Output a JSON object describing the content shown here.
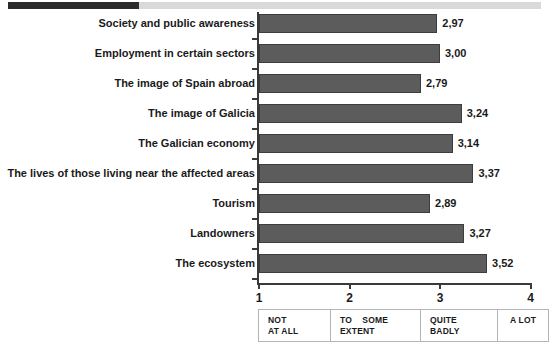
{
  "header_strip": {
    "name": "progress-strip",
    "fill_color": "#2b2b2b",
    "track_color": "#d9d9d9"
  },
  "chart_data": {
    "type": "bar",
    "orientation": "horizontal",
    "title": "",
    "xlabel": "",
    "ylabel": "",
    "xlim": [
      1,
      4
    ],
    "grid": false,
    "legend_position": "below-axis",
    "bar_color": "#5c5c5c",
    "categories": [
      "Society and public awareness",
      "Employment in certain sectors",
      "The image of Spain abroad",
      "The image of Galicia",
      "The Galician economy",
      "The lives of those living near the affected areas",
      "Tourism",
      "Landowners",
      "The ecosystem"
    ],
    "values": [
      2.97,
      3.0,
      2.79,
      3.24,
      3.14,
      3.37,
      2.89,
      3.27,
      3.52
    ],
    "value_labels": [
      "2,97",
      "3,00",
      "2,79",
      "3,24",
      "3,14",
      "3,37",
      "2,89",
      "3,27",
      "3,52"
    ],
    "x_ticks": [
      1,
      2,
      3,
      4
    ],
    "x_tick_labels": [
      "1",
      "2",
      "3",
      "4"
    ],
    "scale_legend": [
      {
        "line1": "NOT",
        "line2": "AT ALL",
        "value": 1
      },
      {
        "line1": "TO    SOME",
        "line2": "EXTENT",
        "value": 2
      },
      {
        "line1": "QUITE",
        "line2": "BADLY",
        "value": 3
      },
      {
        "line1": "A LOT",
        "line2": "",
        "value": 4
      }
    ]
  }
}
